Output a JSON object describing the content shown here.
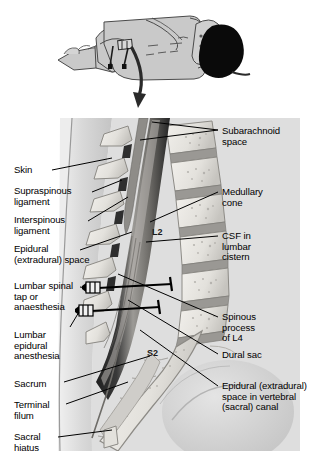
{
  "figure": {
    "panels": {
      "top": {
        "name": "patient-position-inset",
        "description": "Patient in lateral decubitus position with two needles in lumbar region and curved arrow indicating magnified view"
      },
      "main": {
        "name": "sagittal-lumbar-spine",
        "description": "Median sagittal section through lumbar vertebrae, sacrum, spinal cord and dural sac"
      }
    }
  },
  "labels_left": [
    {
      "id": "skin",
      "text": "Skin",
      "x": 14,
      "y": 165,
      "lines": 1
    },
    {
      "id": "supraspinous-ligament",
      "text": "Supraspinous\nligament",
      "x": 14,
      "y": 186,
      "lines": 2
    },
    {
      "id": "interspinous-ligament",
      "text": "Interspinous\nligament",
      "x": 14,
      "y": 215,
      "lines": 2
    },
    {
      "id": "epidural-extradural-space",
      "text": "Epidural\n(extradural) space",
      "x": 14,
      "y": 244,
      "lines": 2
    },
    {
      "id": "lumbar-spinal-tap",
      "text": "Lumbar spinal\ntap or\nanaesthesia",
      "x": 14,
      "y": 281,
      "lines": 3
    },
    {
      "id": "lumbar-epidural-anesthesia",
      "text": "Lumbar\nepidural\nanesthesia",
      "x": 14,
      "y": 330,
      "lines": 3
    },
    {
      "id": "sacrum",
      "text": "Sacrum",
      "x": 14,
      "y": 379,
      "lines": 1
    },
    {
      "id": "terminal-filum",
      "text": "Terminal\nfilum",
      "x": 14,
      "y": 400,
      "lines": 2
    },
    {
      "id": "sacral-hiatus",
      "text": "Sacral\nhiatus",
      "x": 14,
      "y": 432,
      "lines": 2
    }
  ],
  "labels_right": [
    {
      "id": "subarachnoid-space",
      "text": "Subarachnoid\nspace",
      "x": 222,
      "y": 126,
      "lines": 2
    },
    {
      "id": "medullary-cone",
      "text": "Medullary\ncone",
      "x": 222,
      "y": 187,
      "lines": 2
    },
    {
      "id": "csf-in-lumbar-cistern",
      "text": "CSF in\nlumbar\ncistern",
      "x": 222,
      "y": 231,
      "lines": 3
    },
    {
      "id": "spinous-process-of-l4",
      "text": "Spinous\nprocess\nof L4",
      "x": 222,
      "y": 312,
      "lines": 3
    },
    {
      "id": "dural-sac",
      "text": "Dural sac",
      "x": 222,
      "y": 350,
      "lines": 1
    },
    {
      "id": "epidural-space-sacral-canal",
      "text": "Epidural (extradural)\nspace in vertebral\n(sacral) canal",
      "x": 222,
      "y": 381,
      "lines": 3
    }
  ],
  "vertebra_markers": [
    {
      "id": "l2",
      "text": "L2",
      "x": 152,
      "y": 231
    },
    {
      "id": "s2",
      "text": "S2",
      "x": 150,
      "y": 352
    }
  ],
  "needles": [
    {
      "id": "spinal-tap-needle",
      "label_ref": "lumbar-spinal-tap",
      "hub_x": 95,
      "hub_y": 288
    },
    {
      "id": "epidural-needle",
      "label_ref": "lumbar-epidural-anesthesia",
      "hub_x": 88,
      "hub_y": 311
    }
  ],
  "colors": {
    "background": "#ffffff",
    "soft_tissue": "#d9d9d9",
    "soft_tissue_light": "#e6e6e6",
    "bone": "#e9e7e3",
    "bone_shadow": "#b9b7b2",
    "disc": "#9a9894",
    "dura_dark": "#2c2c2c",
    "cord": "#8e8c88",
    "csf": "#c9c7c3",
    "skin_outline": "#7a7a7a",
    "hair": "#0a0a0a",
    "leader_line": "#000000",
    "text": "#000000"
  }
}
